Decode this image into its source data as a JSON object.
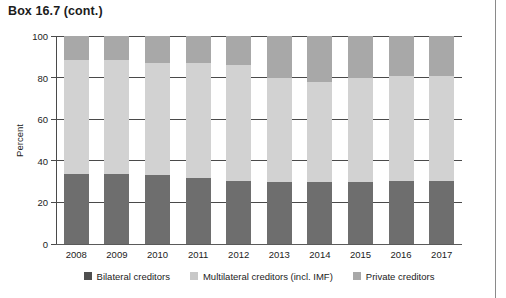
{
  "box_label": "Box 16.7  (cont.)",
  "colors": {
    "bilateral": "#6e6e6e",
    "multilateral": "#d2d2d2",
    "private": "#a8a8a8",
    "axis": "#4a4a4a",
    "text": "#1c1c1c",
    "frame_rule": "#8a8a8a"
  },
  "legend": {
    "items": [
      {
        "label": "Bilateral creditors",
        "color_key": "bilateral",
        "swatch": "#4f4f4f"
      },
      {
        "label": "Multilateral creditors (incl. IMF)",
        "color_key": "multilateral",
        "swatch": "#c8c8c8"
      },
      {
        "label": "Private creditors",
        "color_key": "private",
        "swatch": "#a8a8a8"
      }
    ]
  },
  "chart_data": {
    "type": "bar",
    "stacked": true,
    "normalized_to_100": true,
    "title": "",
    "subtitle": "",
    "xlabel": "",
    "ylabel": "Percent",
    "ylim": [
      0,
      100
    ],
    "yticks": [
      0,
      20,
      40,
      60,
      80,
      100
    ],
    "ytick_labels": [
      "0",
      "20",
      "40",
      "60",
      "80",
      "100"
    ],
    "grid": true,
    "grid_axis": "y",
    "legend_position": "bottom",
    "categories": [
      "2008",
      "2009",
      "2010",
      "2011",
      "2012",
      "2013",
      "2014",
      "2015",
      "2016",
      "2017"
    ],
    "series": [
      {
        "name": "Bilateral creditors",
        "color": "#6e6e6e",
        "values": [
          33.5,
          33.5,
          33.0,
          31.5,
          30.5,
          30.0,
          30.0,
          30.0,
          30.5,
          30.5
        ]
      },
      {
        "name": "Multilateral creditors (incl. IMF)",
        "color": "#d2d2d2",
        "values": [
          55.0,
          55.0,
          54.0,
          55.5,
          55.5,
          50.0,
          48.0,
          50.0,
          50.5,
          50.5
        ]
      },
      {
        "name": "Private creditors",
        "color": "#a8a8a8",
        "values": [
          11.5,
          11.5,
          13.0,
          13.0,
          14.0,
          20.0,
          22.0,
          20.0,
          19.0,
          19.0
        ]
      }
    ],
    "segment_tops": {
      "note": "cumulative upper bound of multilateral segment, percent",
      "values": [
        88.5,
        88.5,
        87.0,
        87.0,
        86.0,
        80.0,
        78.0,
        80.0,
        81.0,
        81.0
      ]
    }
  }
}
